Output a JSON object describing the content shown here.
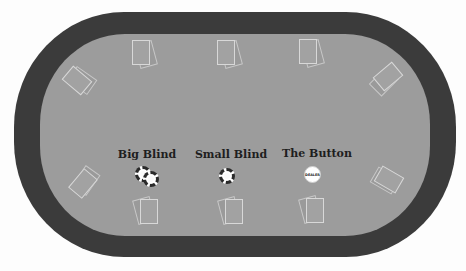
{
  "table": {
    "rail_color": "#3b3b3b",
    "felt_color": "#9c9c9c"
  },
  "positions": {
    "big_blind": {
      "label": "Big Blind"
    },
    "small_blind": {
      "label": "Small Blind"
    },
    "button": {
      "label": "The Button",
      "dealer_text": "DEALER"
    }
  },
  "seats": [
    {
      "id": 1,
      "location": "top-left-end"
    },
    {
      "id": 2,
      "location": "top-1"
    },
    {
      "id": 3,
      "location": "top-2"
    },
    {
      "id": 4,
      "location": "top-3"
    },
    {
      "id": 5,
      "location": "top-right-end"
    },
    {
      "id": 6,
      "location": "bottom-right-end"
    },
    {
      "id": 7,
      "location": "bottom-3"
    },
    {
      "id": 8,
      "location": "bottom-2"
    },
    {
      "id": 9,
      "location": "bottom-1"
    },
    {
      "id": 10,
      "location": "bottom-left-end"
    }
  ]
}
